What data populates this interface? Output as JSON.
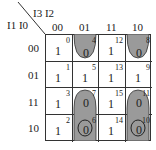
{
  "corner": {
    "col_vars": "I3 I2",
    "row_vars": "I1 I0"
  },
  "col_headers": [
    "00",
    "01",
    "11",
    "10"
  ],
  "row_headers": [
    "00",
    "01",
    "11",
    "10"
  ],
  "cells": [
    [
      {
        "value": "1",
        "index": "0"
      },
      {
        "value": "0",
        "index": "4"
      },
      {
        "value": "1",
        "index": "12"
      },
      {
        "value": "0",
        "index": "8"
      }
    ],
    [
      {
        "value": "1",
        "index": "1"
      },
      {
        "value": "1",
        "index": "5"
      },
      {
        "value": "1",
        "index": "13"
      },
      {
        "value": "1",
        "index": "9"
      }
    ],
    [
      {
        "value": "1",
        "index": "3"
      },
      {
        "value": "0",
        "index": "7"
      },
      {
        "value": "1",
        "index": "15"
      },
      {
        "value": "0",
        "index": "11"
      }
    ],
    [
      {
        "value": "1",
        "index": "2"
      },
      {
        "value": "0",
        "index": "6"
      },
      {
        "value": "1",
        "index": "14"
      },
      {
        "value": "0",
        "index": "10"
      }
    ]
  ],
  "groupings": [
    {
      "cells": [
        "4",
        "8"
      ],
      "style": "shaded wrap-around top"
    },
    {
      "cells": [
        "7",
        "6",
        "11",
        "10"
      ],
      "style": "shaded wrap-around bottom"
    },
    {
      "cells": [
        "6",
        "10"
      ],
      "style": "circled"
    }
  ],
  "colors": {
    "shade": "#9a9a9a",
    "line": "#333333"
  }
}
